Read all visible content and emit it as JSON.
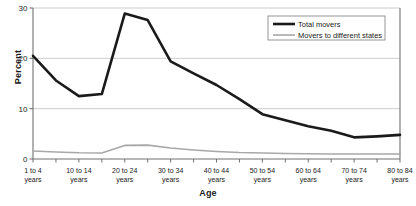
{
  "chart_data": {
    "type": "line",
    "title": "",
    "xlabel": "Age",
    "ylabel": "Percent",
    "ylim": [
      0,
      30
    ],
    "yticks": [
      0,
      10,
      20,
      30
    ],
    "grid": true,
    "legend_position": "top-right",
    "categories": [
      "1 to 4 years",
      "5 to 9 years",
      "10 to 14 years",
      "15 to 19 years",
      "20 to 24 years",
      "25 to 29 years",
      "30 to 34 years",
      "35 to 39 years",
      "40 to 44 years",
      "45 to 49 years",
      "50 to 54 years",
      "55 to 59 years",
      "60 to 64 years",
      "65 to 69 years",
      "70 to 74 years",
      "75 to 79 years",
      "80 to 84 years"
    ],
    "tick_labels": [
      "1 to 4\nyears",
      "10 to 14\nyears",
      "20 to 24\nyears",
      "30 to 34\nyears",
      "40 to 44\nyears",
      "50 to 54\nyears",
      "60 to 64\nyears",
      "70 to 74\nyears",
      "80 to 84\nyears"
    ],
    "series": [
      {
        "name": "Total movers",
        "color": "#1a1a1a",
        "width": 2.6,
        "values": [
          20.5,
          15.6,
          12.5,
          12.9,
          28.9,
          27.6,
          19.4,
          17.0,
          14.7,
          11.9,
          8.9,
          7.7,
          6.5,
          5.6,
          4.3,
          4.5,
          4.8
        ]
      },
      {
        "name": "Movers to different states",
        "color": "#a8a8a8",
        "width": 1.6,
        "values": [
          1.6,
          1.4,
          1.25,
          1.2,
          2.7,
          2.75,
          2.2,
          1.8,
          1.5,
          1.3,
          1.2,
          1.1,
          1.05,
          1.0,
          1.0,
          1.0,
          1.0
        ]
      }
    ]
  },
  "axis": {
    "ytick_labels": [
      "0",
      "10",
      "20",
      "30"
    ]
  },
  "legend": {
    "items": [
      {
        "label": "Total movers"
      },
      {
        "label": "Movers to different states"
      }
    ]
  },
  "xaxis_tick_lines": [
    {
      "line1": "1 to 4",
      "line2": "years"
    },
    {
      "line1": "10 to 14",
      "line2": "years"
    },
    {
      "line1": "20 to 24",
      "line2": "years"
    },
    {
      "line1": "30 to 34",
      "line2": "years"
    },
    {
      "line1": "40 to 44",
      "line2": "years"
    },
    {
      "line1": "50 to 54",
      "line2": "years"
    },
    {
      "line1": "60 to 64",
      "line2": "years"
    },
    {
      "line1": "70 to 74",
      "line2": "years"
    },
    {
      "line1": "80 to 84",
      "line2": "years"
    }
  ]
}
